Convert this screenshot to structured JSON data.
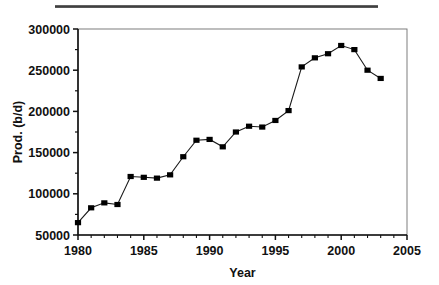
{
  "chart_data": {
    "type": "line",
    "title": "",
    "xlabel": "Year",
    "ylabel": "Prod. (b/d)",
    "xlim": [
      1980,
      2005
    ],
    "ylim": [
      50000,
      300000
    ],
    "xticks": [
      1980,
      1985,
      1990,
      1995,
      2000,
      2005
    ],
    "xtick_labels": [
      "1980",
      "1985",
      "1990",
      "1995",
      "2000",
      "2005"
    ],
    "yticks": [
      50000,
      100000,
      150000,
      200000,
      250000,
      300000
    ],
    "ytick_labels": [
      "50000",
      "100000",
      "150000",
      "200000",
      "250000",
      "300000"
    ],
    "x_minor_tick_interval": 1,
    "y_minor_tick_interval": 25000,
    "grid": false,
    "legend": null,
    "marker": "filled-square",
    "line_color": "#1a1a1a",
    "marker_color": "#000000",
    "x": [
      1980,
      1981,
      1982,
      1983,
      1984,
      1985,
      1986,
      1987,
      1988,
      1989,
      1990,
      1991,
      1992,
      1993,
      1994,
      1995,
      1996,
      1997,
      1998,
      1999,
      2000,
      2001,
      2002,
      2003
    ],
    "values": [
      65000,
      83000,
      89000,
      87000,
      121000,
      120000,
      119000,
      123000,
      145000,
      165000,
      166000,
      157000,
      175000,
      182000,
      181000,
      189000,
      201000,
      254000,
      265000,
      270000,
      280000,
      275000,
      250000,
      240000
    ],
    "series": [
      {
        "name": "Production",
        "values": [
          65000,
          83000,
          89000,
          87000,
          121000,
          120000,
          119000,
          123000,
          145000,
          165000,
          166000,
          157000,
          175000,
          182000,
          181000,
          189000,
          201000,
          254000,
          265000,
          270000,
          280000,
          275000,
          250000,
          240000
        ]
      }
    ]
  },
  "figure": {
    "scan_rule_label": "scan-artifact-rule"
  }
}
